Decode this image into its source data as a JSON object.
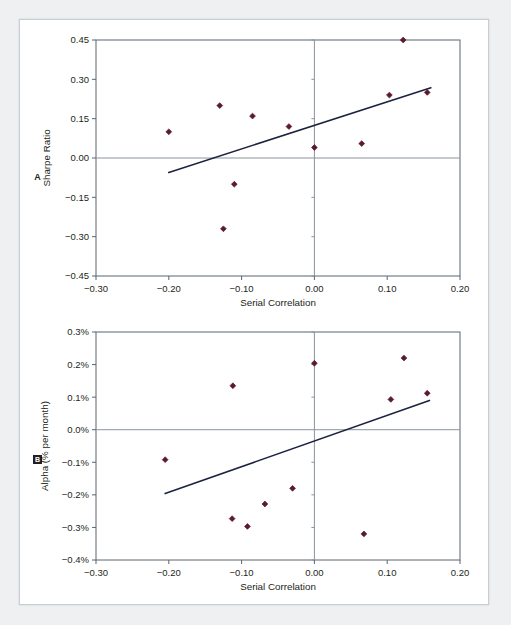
{
  "figure": {
    "background_color": "#eef0f1",
    "card_color": "#ffffff",
    "border_color": "#c9ced2",
    "marker_color": "#5c1a2e",
    "trendline_color": "#1b2340",
    "axis_color": "#5a6570",
    "zeroline_color": "#8b949c"
  },
  "panels": [
    {
      "id": "A",
      "letter": "A"
    },
    {
      "id": "B",
      "letter": "B"
    }
  ],
  "chart_data": [
    {
      "type": "scatter",
      "panel": "A",
      "title": "",
      "xlabel": "Serial Correlation",
      "ylabel": "Sharpe Ratio",
      "xlim": [
        -0.3,
        0.2
      ],
      "ylim": [
        -0.45,
        0.45
      ],
      "xticks": [
        -0.3,
        -0.2,
        -0.1,
        0.0,
        0.1,
        0.2
      ],
      "xticklabels": [
        "−0.30",
        "−0.20",
        "−0.10",
        "0.00",
        "0.10",
        "0.20"
      ],
      "yticks": [
        0.45,
        0.3,
        0.15,
        0.0,
        -0.15,
        -0.3,
        -0.45
      ],
      "yticklabels": [
        "0.45",
        "0.30",
        "0.15",
        "0.00",
        "−0.15",
        "−0.30",
        "−0.45"
      ],
      "grid": false,
      "legend": "none",
      "zero_lines": {
        "horizontal_y": 0.0,
        "vertical_x": 0.0
      },
      "points": [
        {
          "x": -0.2,
          "y": 0.1
        },
        {
          "x": -0.13,
          "y": 0.2
        },
        {
          "x": -0.125,
          "y": -0.27
        },
        {
          "x": -0.11,
          "y": -0.1
        },
        {
          "x": -0.085,
          "y": 0.16
        },
        {
          "x": -0.035,
          "y": 0.12
        },
        {
          "x": 0.0,
          "y": 0.04
        },
        {
          "x": 0.065,
          "y": 0.055
        },
        {
          "x": 0.103,
          "y": 0.24
        },
        {
          "x": 0.122,
          "y": 0.45
        },
        {
          "x": 0.155,
          "y": 0.25
        }
      ],
      "trendline": {
        "x1": -0.2,
        "y1": -0.055,
        "x2": 0.16,
        "y2": 0.268
      }
    },
    {
      "type": "scatter",
      "panel": "B",
      "title": "",
      "xlabel": "Serial Correlation",
      "ylabel": "Alpha (% per month)",
      "xlim": [
        -0.3,
        0.2
      ],
      "ylim": [
        -0.4,
        0.3
      ],
      "xticks": [
        -0.3,
        -0.2,
        -0.1,
        0.0,
        0.1,
        0.2
      ],
      "xticklabels": [
        "−0.30",
        "−0.20",
        "−0.10",
        "0.00",
        "0.10",
        "0.20"
      ],
      "yticks": [
        0.3,
        0.2,
        0.1,
        0.0,
        -0.1,
        -0.2,
        -0.3,
        -0.4
      ],
      "yticklabels": [
        "0.3%",
        "0.2%",
        "0.1%",
        "0.0%",
        "−0.1%",
        "−0.2%",
        "−0.3%",
        "−0.4%"
      ],
      "grid": false,
      "legend": "none",
      "zero_lines": {
        "horizontal_y": 0.0,
        "vertical_x": 0.0
      },
      "points": [
        {
          "x": -0.205,
          "y": -0.092
        },
        {
          "x": -0.112,
          "y": 0.135
        },
        {
          "x": -0.113,
          "y": -0.273
        },
        {
          "x": -0.092,
          "y": -0.297
        },
        {
          "x": -0.068,
          "y": -0.228
        },
        {
          "x": -0.03,
          "y": -0.18
        },
        {
          "x": 0.0,
          "y": 0.204
        },
        {
          "x": 0.068,
          "y": -0.32
        },
        {
          "x": 0.105,
          "y": 0.093
        },
        {
          "x": 0.123,
          "y": 0.22
        },
        {
          "x": 0.155,
          "y": 0.112
        }
      ],
      "trendline": {
        "x1": -0.205,
        "y1": -0.196,
        "x2": 0.158,
        "y2": 0.09
      }
    }
  ]
}
